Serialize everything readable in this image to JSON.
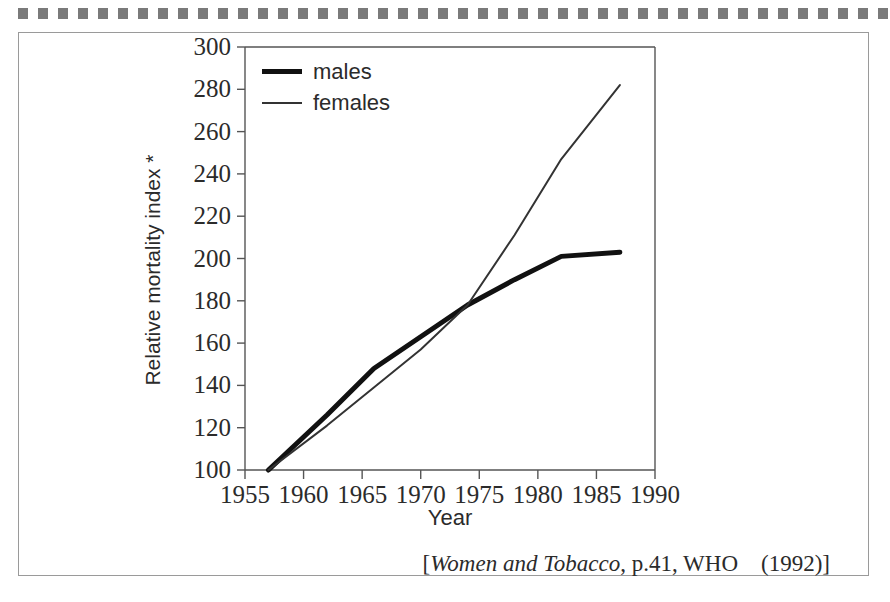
{
  "figure": {
    "decoration": {
      "square_count": 44,
      "square_color": "#7a7a7a"
    },
    "frame_color": "#9a9a9a"
  },
  "citation": {
    "open_bracket": "[",
    "title": "Women and  Tobacco",
    "rest": ", p.41, WHO　(1992)",
    "close_bracket": "]"
  },
  "chart_data": {
    "type": "line",
    "title": "",
    "subtitle": "",
    "xlabel": "Year",
    "ylabel": "Relative mortality index *",
    "xlim": [
      1955,
      1990
    ],
    "ylim": [
      100,
      300
    ],
    "xticks": [
      1955,
      1960,
      1965,
      1970,
      1975,
      1980,
      1985,
      1990
    ],
    "yticks": [
      100,
      120,
      140,
      160,
      180,
      200,
      220,
      240,
      260,
      280,
      300
    ],
    "xtick_labels": [
      "1955",
      "1960",
      "1965",
      "1970",
      "1975",
      "1980",
      "1985",
      "1990"
    ],
    "ytick_labels": [
      "100",
      "120",
      "140",
      "160",
      "180",
      "200",
      "220",
      "240",
      "260",
      "280",
      "300"
    ],
    "grid": false,
    "legend_position": "top-left",
    "legend": [
      "males",
      "females"
    ],
    "series": [
      {
        "name": "males",
        "style": "thick",
        "color": "#111111",
        "line_width": 5,
        "x": [
          1957,
          1962,
          1966,
          1970,
          1974,
          1978,
          1982,
          1987
        ],
        "values": [
          100,
          126,
          148,
          163,
          178,
          190,
          201,
          203
        ]
      },
      {
        "name": "females",
        "style": "thin",
        "color": "#333333",
        "line_width": 2,
        "x": [
          1957,
          1962,
          1966,
          1970,
          1974,
          1978,
          1982,
          1987
        ],
        "values": [
          100,
          121,
          139,
          157,
          178,
          211,
          247,
          282
        ]
      }
    ],
    "annotations": [
      "* footnote marker on y-axis title"
    ]
  }
}
